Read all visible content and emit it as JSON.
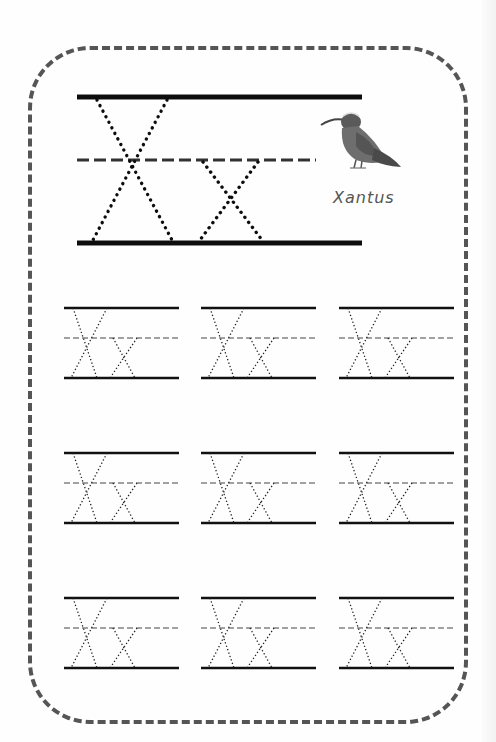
{
  "worksheet": {
    "letter_upper": "X",
    "letter_lower": "x",
    "example_word": "Xantus",
    "picture": "xantus-hummingbird",
    "practice_rows": 3,
    "practice_columns": 3
  },
  "colors": {
    "line": "#111111",
    "border": "#555555",
    "bird_body": "#6e6e6e",
    "bird_dark": "#444444"
  }
}
